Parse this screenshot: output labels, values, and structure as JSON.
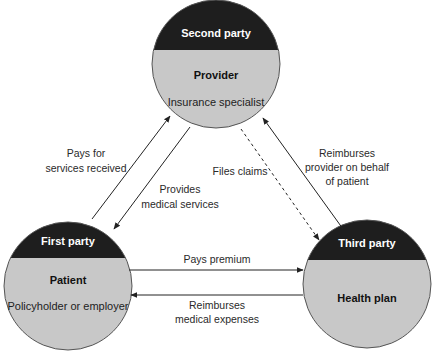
{
  "colors": {
    "header_fill": "#1e1e1e",
    "body_fill": "#c8c8c8",
    "outline": "#555555",
    "arrow": "#222222"
  },
  "nodes": {
    "second_party": {
      "header": "Second party",
      "title": "Provider",
      "subtitle": "Insurance specialist"
    },
    "first_party": {
      "header": "First party",
      "title": "Patient",
      "subtitle": "Policyholder or employer"
    },
    "third_party": {
      "header": "Third party",
      "title": "Health plan"
    }
  },
  "flows": {
    "pays_for_services": {
      "line1": "Pays for",
      "line2": "services received",
      "style": "solid"
    },
    "provides_services": {
      "line1": "Provides",
      "line2": "medical services",
      "style": "solid"
    },
    "files_claims": {
      "line1": "Files claims",
      "style": "dashed"
    },
    "reimburses_provider": {
      "line1": "Reimburses",
      "line2": "provider on behalf",
      "line3": "of patient",
      "style": "solid"
    },
    "pays_premium": {
      "line1": "Pays premium",
      "style": "solid"
    },
    "reimburses_expenses": {
      "line1": "Reimburses",
      "line2": "medical expenses",
      "style": "solid"
    }
  }
}
